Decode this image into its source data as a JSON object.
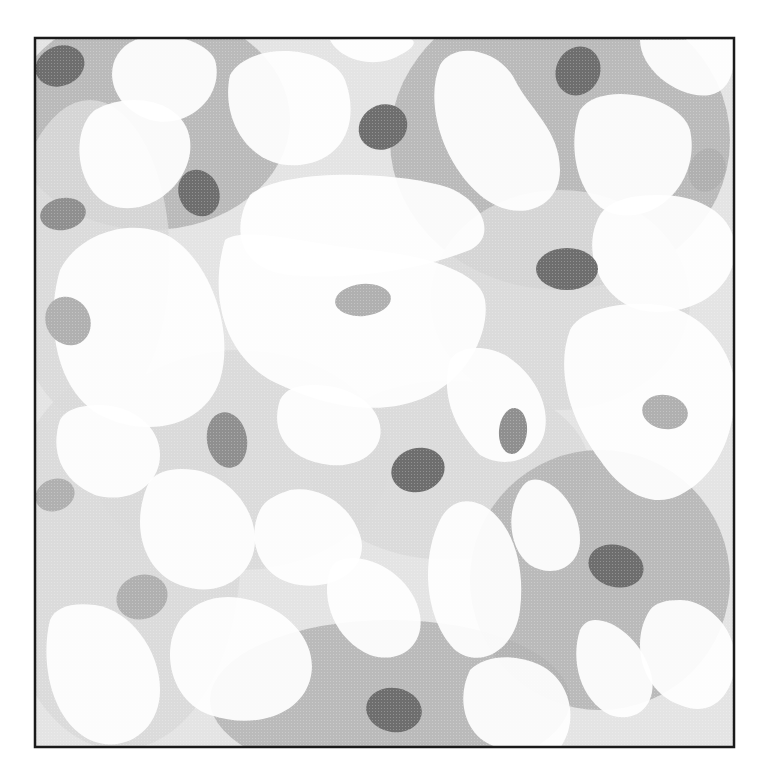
{
  "image": {
    "description": "Abstract illustration of interconnected cells with gray cytoplasm networks and oval nuclei inside a black square frame",
    "frame": {
      "x": 34,
      "y": 37,
      "width": 701,
      "height": 711,
      "stroke": "#1a1a1a"
    },
    "colors": {
      "background": "#ffffff",
      "cytoplasm_dark": "#b3b3b3",
      "cytoplasm_light": "#d9d9d9",
      "nucleus_dark": "#6e6e6e",
      "nucleus_medium": "#8f8f8f",
      "nucleus_light": "#b0b0b0",
      "cell_body": "#ffffff"
    },
    "nuclei": [
      {
        "cx": 60,
        "cy": 66,
        "rx": 25,
        "ry": 20,
        "rot": -20,
        "tone": "dark"
      },
      {
        "cx": 383,
        "cy": 127,
        "rx": 25,
        "ry": 22,
        "rot": -30,
        "tone": "dark"
      },
      {
        "cx": 199,
        "cy": 193,
        "rx": 20,
        "ry": 24,
        "rot": -25,
        "tone": "dark"
      },
      {
        "cx": 567,
        "cy": 269,
        "rx": 31,
        "ry": 21,
        "rot": 0,
        "tone": "dark"
      },
      {
        "cx": 578,
        "cy": 71,
        "rx": 22,
        "ry": 25,
        "rot": 25,
        "tone": "dark"
      },
      {
        "cx": 616,
        "cy": 566,
        "rx": 28,
        "ry": 21,
        "rot": 15,
        "tone": "dark"
      },
      {
        "cx": 394,
        "cy": 710,
        "rx": 28,
        "ry": 22,
        "rot": 10,
        "tone": "dark"
      },
      {
        "cx": 418,
        "cy": 470,
        "rx": 27,
        "ry": 22,
        "rot": -15,
        "tone": "dark"
      },
      {
        "cx": 227,
        "cy": 440,
        "rx": 20,
        "ry": 28,
        "rot": -10,
        "tone": "medium"
      },
      {
        "cx": 513,
        "cy": 431,
        "rx": 14,
        "ry": 23,
        "rot": 5,
        "tone": "medium"
      },
      {
        "cx": 63,
        "cy": 214,
        "rx": 23,
        "ry": 16,
        "rot": -10,
        "tone": "medium"
      },
      {
        "cx": 363,
        "cy": 300,
        "rx": 28,
        "ry": 16,
        "rot": -5,
        "tone": "light"
      },
      {
        "cx": 707,
        "cy": 170,
        "rx": 18,
        "ry": 22,
        "rot": 20,
        "tone": "light"
      },
      {
        "cx": 665,
        "cy": 412,
        "rx": 23,
        "ry": 17,
        "rot": 10,
        "tone": "light"
      },
      {
        "cx": 68,
        "cy": 321,
        "rx": 22,
        "ry": 25,
        "rot": -30,
        "tone": "light"
      },
      {
        "cx": 142,
        "cy": 597,
        "rx": 26,
        "ry": 22,
        "rot": -20,
        "tone": "light"
      },
      {
        "cx": 55,
        "cy": 495,
        "rx": 20,
        "ry": 16,
        "rot": -20,
        "tone": "light"
      }
    ],
    "gray_regions": [
      {
        "cx": 150,
        "cy": 120,
        "rx": 140,
        "ry": 110,
        "tone": "cytoplasm_dark"
      },
      {
        "cx": 560,
        "cy": 140,
        "rx": 170,
        "ry": 150,
        "tone": "cytoplasm_dark"
      },
      {
        "cx": 560,
        "cy": 300,
        "rx": 130,
        "ry": 110,
        "tone": "cytoplasm_light"
      },
      {
        "cx": 240,
        "cy": 460,
        "rx": 150,
        "ry": 110,
        "tone": "cytoplasm_light"
      },
      {
        "cx": 450,
        "cy": 470,
        "rx": 140,
        "ry": 90,
        "tone": "cytoplasm_light"
      },
      {
        "cx": 600,
        "cy": 580,
        "rx": 130,
        "ry": 130,
        "tone": "cytoplasm_dark"
      },
      {
        "cx": 390,
        "cy": 700,
        "rx": 180,
        "ry": 80,
        "tone": "cytoplasm_dark"
      },
      {
        "cx": 120,
        "cy": 560,
        "rx": 120,
        "ry": 190,
        "tone": "cytoplasm_light"
      },
      {
        "cx": 90,
        "cy": 260,
        "rx": 80,
        "ry": 160,
        "tone": "cytoplasm_light"
      }
    ],
    "white_blobs": [
      {
        "d": "M95,110 C70,130 75,190 110,205 C150,220 195,180 190,140 C185,100 130,90 95,110 Z"
      },
      {
        "d": "M135,40 C100,55 105,105 150,120 C190,130 225,95 215,60 C205,38 160,30 135,40 Z"
      },
      {
        "d": "M230,75 C220,120 250,170 300,165 C345,160 360,120 345,80 C330,45 250,40 230,75 Z"
      },
      {
        "d": "M330,40 C340,60 375,70 400,55 C420,45 415,38 405,38 Z"
      },
      {
        "d": "M440,65 C425,100 440,160 480,195 C515,225 560,210 560,170 C560,130 530,110 515,80 C500,50 455,40 440,65 Z"
      },
      {
        "d": "M580,110 C565,150 580,210 620,215 C665,220 700,175 690,130 C680,95 600,80 580,110 Z"
      },
      {
        "d": "M640,40 C640,70 680,100 710,95 C735,90 735,60 735,40 Z"
      },
      {
        "d": "M250,195 C230,230 240,270 290,275 C350,280 420,270 470,250 C500,235 480,195 440,185 C380,170 280,170 250,195 Z"
      },
      {
        "d": "M225,240 C210,290 220,350 270,380 C320,405 380,420 430,395 C470,375 490,330 485,300 C480,270 420,255 370,250 C310,245 245,225 225,240 Z"
      },
      {
        "d": "M60,270 C45,320 55,390 100,415 C150,440 205,425 220,380 C235,330 210,265 175,240 C140,215 80,230 60,270 Z"
      },
      {
        "d": "M600,215 C580,250 600,300 640,310 C690,320 735,290 735,250 C735,215 700,195 660,195 C630,195 610,200 600,215 Z"
      },
      {
        "d": "M570,330 C555,370 570,420 600,460 C620,490 650,510 680,495 C720,475 735,430 735,390 C735,350 700,310 660,305 C620,300 580,310 570,330 Z"
      },
      {
        "d": "M450,360 C440,395 455,430 480,455 C505,470 540,460 545,430 C550,400 530,370 505,355 C485,345 460,345 450,360 Z"
      },
      {
        "d": "M280,400 C270,430 285,460 330,465 C360,468 385,450 380,425 C375,400 345,385 315,385 C295,385 285,390 280,400 Z"
      },
      {
        "d": "M260,510 C245,540 260,580 300,585 C340,590 370,565 360,535 C350,505 320,485 290,490 C275,495 265,500 260,510 Z"
      },
      {
        "d": "M440,520 C420,560 425,620 455,650 C480,670 515,650 520,610 C525,570 515,530 490,510 C470,495 450,500 440,520 Z"
      },
      {
        "d": "M520,490 C505,515 510,550 530,565 C555,580 580,565 580,540 C580,510 560,485 540,480 C530,478 525,482 520,490 Z"
      },
      {
        "d": "M650,610 C630,640 640,690 680,705 C715,720 735,690 735,660 C735,625 705,600 680,600 C665,600 655,603 650,610 Z"
      },
      {
        "d": "M470,670 C455,700 465,740 500,748 L560,748 C580,720 570,680 540,665 C515,653 485,655 470,670 Z"
      },
      {
        "d": "M580,630 C570,660 580,700 610,715 C640,725 660,700 650,670 C640,640 615,620 595,620 C588,620 583,624 580,630 Z"
      },
      {
        "d": "M330,570 C320,600 335,640 370,655 C400,665 425,645 420,615 C415,585 385,560 355,558 C340,558 333,562 330,570 Z"
      },
      {
        "d": "M180,620 C160,650 170,700 210,715 C255,730 300,715 310,680 C320,645 290,610 250,600 C220,592 195,600 180,620 Z"
      },
      {
        "d": "M50,620 C40,660 50,720 90,740 C125,755 160,730 160,690 C160,650 130,610 95,605 C70,602 55,608 50,620 Z"
      },
      {
        "d": "M60,420 C50,450 60,480 95,495 C130,505 160,485 160,455 C160,425 130,405 100,405 C80,405 65,410 60,420 Z"
      },
      {
        "d": "M150,480 C130,520 140,570 180,585 C220,600 255,575 255,540 C255,505 225,475 195,470 C175,467 160,470 150,480 Z"
      }
    ]
  }
}
